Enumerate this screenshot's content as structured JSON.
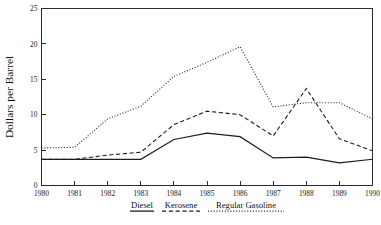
{
  "chart_data": {
    "type": "line",
    "title": "",
    "xlabel": "",
    "ylabel": "Dollars per Barrel",
    "x": [
      1980,
      1981,
      1982,
      1983,
      1984,
      1985,
      1986,
      1987,
      1988,
      1989,
      1990
    ],
    "xtick_labels": [
      "1980",
      "1981",
      "1982",
      "1983",
      "1984",
      "1985",
      "1986",
      "1987",
      "1988",
      "1989",
      "1990"
    ],
    "ytick_labels": [
      "0",
      "5",
      "10",
      "15",
      "20",
      "25"
    ],
    "yticks": [
      0,
      5,
      10,
      15,
      20,
      25
    ],
    "ylim": [
      0,
      25
    ],
    "xlim": [
      1980,
      1990
    ],
    "grid": false,
    "legend_position": "below-axis",
    "series": [
      {
        "name": "Diesel",
        "style": "solid",
        "color": "#1c1c1c",
        "values": [
          3.7,
          3.7,
          3.7,
          3.7,
          6.5,
          7.4,
          6.9,
          3.9,
          4.0,
          3.2,
          3.7
        ]
      },
      {
        "name": "Kerosene",
        "style": "dashed",
        "color": "#1c1c1c",
        "values": [
          3.7,
          3.7,
          4.3,
          4.7,
          8.6,
          10.5,
          10.0,
          7.0,
          13.7,
          6.6,
          4.9
        ]
      },
      {
        "name": "Regular Gasoline",
        "style": "dotted",
        "color": "#2a2a2a",
        "values": [
          5.3,
          5.4,
          9.4,
          11.2,
          15.4,
          17.4,
          19.6,
          11.1,
          11.7,
          11.7,
          9.4
        ]
      }
    ]
  },
  "legend": {
    "items": [
      {
        "label": "Diesel",
        "style": "solid"
      },
      {
        "label": "Kerosene",
        "style": "dashed"
      },
      {
        "label": "Regular Gasoline",
        "style": "dotted"
      }
    ]
  }
}
